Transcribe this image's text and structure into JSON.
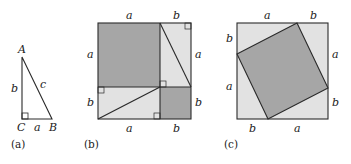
{
  "colors": {
    "line": "#2a2a2a",
    "dark_fill": "#a6a6a6",
    "light_fill": "#e2e2e2",
    "background": "#ffffff"
  },
  "panel_a": {
    "caption": "(a)",
    "vertices": {
      "A": "A",
      "B": "B",
      "C": "C"
    },
    "sides": {
      "vertical": "b",
      "hypotenuse": "c",
      "base": "a"
    }
  },
  "panel_b": {
    "caption": "(b)",
    "top_labels": [
      "a",
      "b"
    ],
    "bottom_labels": [
      "a",
      "b"
    ],
    "left_labels": [
      "a",
      "b"
    ],
    "right_labels": [
      "a",
      "b"
    ]
  },
  "panel_c": {
    "caption": "(c)",
    "top_labels": [
      "a",
      "b"
    ],
    "bottom_labels": [
      "b",
      "a"
    ],
    "left_labels": [
      "b",
      "a"
    ],
    "right_labels": [
      "a",
      "b"
    ]
  }
}
